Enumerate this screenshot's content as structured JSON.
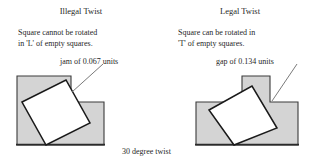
{
  "figure": {
    "caption": "30 degree twist",
    "background_color": "#ffffff",
    "shape_fill_color": "#d4d4d4",
    "shape_stroke_color": "#3a3a3a",
    "square_fill_color": "#ffffff",
    "square_stroke_color": "#1a1a1a",
    "leader_line_color": "#6b6b6b"
  },
  "panels": [
    {
      "id": "illegal",
      "title": "Illegal Twist",
      "description_line1": "Square cannot be rotated",
      "description_line2": "in 'L' of empty squares.",
      "callout": "jam of 0.067 units",
      "container_shape": "L",
      "twist_degrees": 30
    },
    {
      "id": "legal",
      "title": "Legal Twist",
      "description_line1": "Square can be rotated in",
      "description_line2": "'T' of empty squares.",
      "callout": "gap of 0.134 units",
      "container_shape": "T",
      "twist_degrees": 30
    }
  ]
}
